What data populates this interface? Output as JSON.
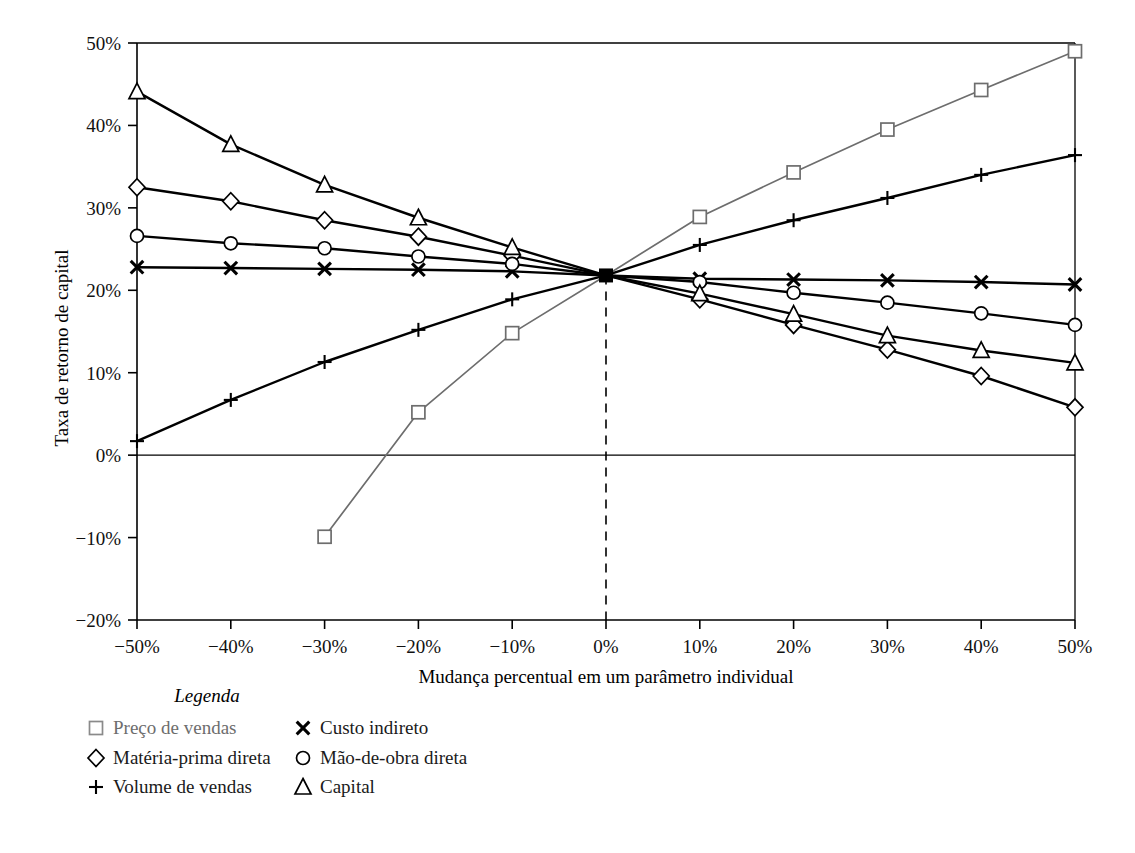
{
  "chart_data": {
    "type": "line",
    "title": "",
    "xlabel": "Mudança percentual em um parâmetro individual",
    "ylabel": "Taxa de retorno de capital",
    "x": [
      -50,
      -40,
      -30,
      -20,
      -10,
      0,
      10,
      20,
      30,
      40,
      50
    ],
    "xlim": [
      -50,
      50
    ],
    "ylim": [
      -20,
      50
    ],
    "xtick_labels": [
      "−50%",
      "−40%",
      "−30%",
      "−20%",
      "−10%",
      "0%",
      "10%",
      "20%",
      "30%",
      "40%",
      "50%"
    ],
    "ytick_values": [
      -20,
      -10,
      0,
      10,
      20,
      30,
      40,
      50
    ],
    "ytick_labels": [
      "−20%",
      "−10%",
      "0%",
      "10%",
      "20%",
      "30%",
      "40%",
      "50%"
    ],
    "grid": false,
    "legend_position": "below-axes",
    "zero_reference_line": 0,
    "vertical_dashed_line_at": 0,
    "convergence_point": {
      "x": 0,
      "y": 21.8,
      "marker": "filled-square"
    },
    "series": [
      {
        "name": "Preço de vendas",
        "marker": "square",
        "color": "#6d6d6d",
        "x": [
          -30,
          -20,
          -10,
          0,
          10,
          20,
          30,
          40,
          50
        ],
        "values": [
          -9.9,
          5.2,
          14.8,
          21.8,
          28.9,
          34.3,
          39.5,
          44.3,
          49.0
        ]
      },
      {
        "name": "Matéria-prima direta",
        "marker": "diamond",
        "color": "#000000",
        "x": [
          -50,
          -40,
          -30,
          -20,
          -10,
          0,
          10,
          20,
          30,
          40,
          50
        ],
        "values": [
          32.5,
          30.8,
          28.5,
          26.5,
          24.2,
          21.8,
          18.9,
          15.8,
          12.8,
          9.6,
          5.8
        ]
      },
      {
        "name": "Volume de vendas",
        "marker": "plus",
        "color": "#000000",
        "x": [
          -50,
          -40,
          -30,
          -20,
          -10,
          0,
          10,
          20,
          30,
          40,
          50
        ],
        "values": [
          1.7,
          6.7,
          11.3,
          15.2,
          18.9,
          21.8,
          25.5,
          28.5,
          31.2,
          34.0,
          36.4
        ]
      },
      {
        "name": "Custo indireto",
        "marker": "cross",
        "color": "#000000",
        "x": [
          -50,
          -40,
          -30,
          -20,
          -10,
          0,
          10,
          20,
          30,
          40,
          50
        ],
        "values": [
          22.8,
          22.7,
          22.6,
          22.5,
          22.3,
          21.8,
          21.4,
          21.3,
          21.2,
          21.0,
          20.7
        ]
      },
      {
        "name": "Mão-de-obra direta",
        "marker": "circle",
        "color": "#000000",
        "x": [
          -50,
          -40,
          -30,
          -20,
          -10,
          0,
          10,
          20,
          30,
          40,
          50
        ],
        "values": [
          26.6,
          25.7,
          25.1,
          24.1,
          23.2,
          21.8,
          21.0,
          19.7,
          18.5,
          17.2,
          15.8
        ]
      },
      {
        "name": "Capital",
        "marker": "triangle",
        "color": "#000000",
        "x": [
          -50,
          -40,
          -30,
          -20,
          -10,
          0,
          10,
          20,
          30,
          40,
          50
        ],
        "values": [
          44.1,
          37.7,
          32.8,
          28.8,
          25.2,
          21.8,
          19.6,
          17.1,
          14.5,
          12.7,
          11.2
        ]
      }
    ]
  },
  "legend": {
    "title": "Legenda",
    "entries": [
      {
        "marker": "□",
        "label": "Preço de vendas",
        "column": 0,
        "muted": true
      },
      {
        "marker": "◇",
        "label": "Matéria-prima direta",
        "column": 0,
        "muted": false
      },
      {
        "marker": "+",
        "label": "Volume de vendas",
        "column": 0,
        "muted": false
      },
      {
        "marker": "✕",
        "label": "Custo indireto",
        "column": 1,
        "muted": false
      },
      {
        "marker": "○",
        "label": "Mão-de-obra direta",
        "column": 1,
        "muted": false
      },
      {
        "marker": "△",
        "label": "Capital",
        "column": 1,
        "muted": false
      }
    ]
  },
  "axes": {
    "y_title": "Taxa de retorno de capital",
    "x_title": "Mudança percentual em um parâmetro individual"
  }
}
